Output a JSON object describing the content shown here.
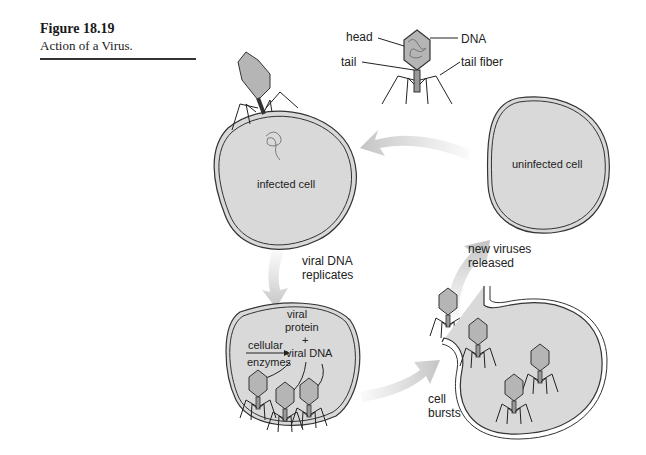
{
  "caption": {
    "figure_number": "Figure 18.19",
    "title": "Action of a Virus."
  },
  "virus_anatomy": {
    "labels": {
      "head": "head",
      "dna": "DNA",
      "tail": "tail",
      "tail_fiber": "tail fiber"
    }
  },
  "stages": {
    "infected_cell": "infected cell",
    "uninfected_cell": "uninfected cell",
    "replicates": [
      "viral DNA",
      "replicates"
    ],
    "assembly": {
      "viral_protein": [
        "viral",
        "protein"
      ],
      "plus": "+",
      "viral_dna": "viral DNA",
      "enzymes": [
        "cellular",
        "enzymes"
      ]
    },
    "released": [
      "new viruses",
      "released"
    ],
    "bursts": [
      "cell",
      "bursts"
    ]
  },
  "colors": {
    "cell_fill": "#d9d9d9",
    "outline": "#333333",
    "arrow": "#c8c8c8",
    "virus_fill": "#b5b5b5"
  }
}
